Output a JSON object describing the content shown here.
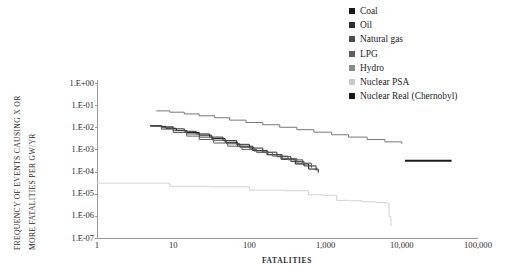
{
  "chart_data": {
    "type": "line",
    "title": "",
    "xlabel": "FATALITIES",
    "ylabel_line1": "FREQUENCY OF EVENTS CAUSING X OR",
    "ylabel_line2": "MORE FATALITIES PER GW/YR",
    "xscale": "log",
    "yscale": "log",
    "xlim": [
      1,
      100000
    ],
    "ylim": [
      1e-07,
      1
    ],
    "grid": false,
    "legend_position": "top-right",
    "x_tick_labels": [
      "1",
      "10",
      "100",
      "1,000",
      "10,000",
      "100,000"
    ],
    "x_tick_values": [
      1,
      10,
      100,
      1000,
      10000,
      100000
    ],
    "y_tick_labels": [
      "1.E+00",
      "1.E-01",
      "1.E-02",
      "1.E-03",
      "1.E-04",
      "1.E-05",
      "1.E-06",
      "1.E-07"
    ],
    "y_tick_values": [
      1,
      0.1,
      0.01,
      0.001,
      0.0001,
      1e-05,
      1e-06,
      1e-07
    ],
    "series": [
      {
        "name": "Coal",
        "color": "#1a1a1a",
        "x": [
          5,
          6,
          8,
          11,
          15,
          22,
          32,
          48,
          70,
          110,
          170,
          260,
          400,
          600,
          800
        ],
        "values": [
          0.0115,
          0.011,
          0.009,
          0.0072,
          0.0058,
          0.0044,
          0.0031,
          0.0021,
          0.0014,
          0.0009,
          0.00058,
          0.00036,
          0.00022,
          0.00013,
          9e-05
        ]
      },
      {
        "name": "Oil",
        "color": "#2e2e2e",
        "x": [
          5,
          7,
          10,
          14,
          20,
          30,
          45,
          68,
          100,
          150,
          230,
          350,
          520,
          750
        ],
        "values": [
          0.012,
          0.0105,
          0.0085,
          0.0066,
          0.005,
          0.0036,
          0.0025,
          0.0017,
          0.00115,
          0.00075,
          0.00047,
          0.00029,
          0.00018,
          0.00011
        ]
      },
      {
        "name": "Natural gas",
        "color": "#4a4a4a",
        "x": [
          5,
          7,
          10,
          15,
          22,
          33,
          50,
          75,
          115,
          175,
          270,
          420,
          650
        ],
        "values": [
          0.0118,
          0.0095,
          0.007,
          0.005,
          0.0036,
          0.0026,
          0.0018,
          0.00125,
          0.00085,
          0.00058,
          0.00038,
          0.00024,
          0.00015
        ]
      },
      {
        "name": "LPG",
        "color": "#5f5f5f",
        "x": [
          5,
          7,
          10,
          15,
          22,
          34,
          52,
          80,
          125,
          200,
          320,
          500
        ],
        "values": [
          0.011,
          0.0082,
          0.0058,
          0.004,
          0.0028,
          0.00195,
          0.0014,
          0.001,
          0.00072,
          0.0005,
          0.00034,
          0.00022
        ]
      },
      {
        "name": "Hydro",
        "color": "#787878",
        "x": [
          6,
          9,
          14,
          22,
          35,
          55,
          90,
          150,
          250,
          420,
          700,
          1200,
          2000,
          3500,
          6000,
          10000
        ],
        "values": [
          0.055,
          0.048,
          0.04,
          0.033,
          0.027,
          0.021,
          0.0165,
          0.013,
          0.01,
          0.0078,
          0.006,
          0.0046,
          0.0036,
          0.0028,
          0.0022,
          0.0018
        ]
      },
      {
        "name": "Nuclear PSA",
        "color": "#d3d3d3",
        "x": [
          1,
          6,
          9,
          30,
          100,
          300,
          600,
          900,
          1400,
          2000,
          3000,
          4500,
          6000,
          6800,
          7200
        ],
        "values": [
          3e-05,
          3e-05,
          2.15e-05,
          2.05e-05,
          1.45e-05,
          1.35e-05,
          9e-06,
          8.5e-06,
          5e-06,
          4.8e-06,
          4.3e-06,
          4e-06,
          3.8e-06,
          9.5e-07,
          3.5e-07
        ]
      },
      {
        "name": "Nuclear Real (Chernobyl)",
        "color": "#1a1a1a",
        "x": [
          11000,
          45000
        ],
        "values": [
          0.00031,
          0.00031
        ]
      }
    ]
  },
  "legend": {
    "items": [
      {
        "label": "Coal",
        "color": "#1a1a1a"
      },
      {
        "label": "Oil",
        "color": "#2e2e2e"
      },
      {
        "label": "Natural gas",
        "color": "#4a4a4a"
      },
      {
        "label": "LPG",
        "color": "#5f5f5f"
      },
      {
        "label": "Hydro",
        "color": "#8a8a8a"
      },
      {
        "label": "Nuclear PSA",
        "color": "#c9c9c9"
      },
      {
        "label": "Nuclear Real (Chernobyl)",
        "color": "#1a1a1a"
      }
    ]
  }
}
